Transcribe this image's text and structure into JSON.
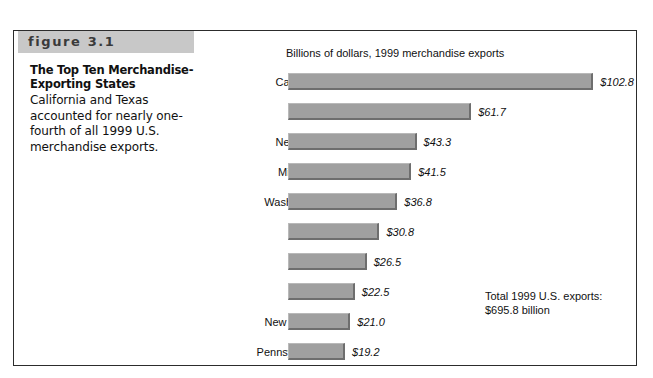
{
  "figure": {
    "band_label": "figure 3.1",
    "caption_title": "The Top Ten Merchandise-Exporting States",
    "caption_body": "California and Texas accounted for nearly one-fourth of all 1999 U.S. merchandise exports.",
    "total_note_line1": "Total 1999 U.S. exports:",
    "total_note_line2": "$695.8 billion"
  },
  "colors": {
    "band_gray": "#c8c8c8",
    "bar_fill": "#a0a0a0",
    "bar_shadow": "#6e6e6e",
    "bar_highlight": "#b9b9b9",
    "frame_border": "#2c2c2c"
  },
  "chart_data": {
    "type": "bar",
    "orientation": "horizontal",
    "title": "Billions of dollars, 1999 merchandise exports",
    "xlabel": "",
    "ylabel": "",
    "grid": false,
    "legend": false,
    "xlim": [
      0,
      110
    ],
    "categories": [
      "California",
      "Texas",
      "New York",
      "Michigan",
      "Washington",
      "Illinois",
      "Ohio",
      "Florida",
      "New Jersey",
      "Pennsylvania"
    ],
    "values": [
      102.8,
      61.7,
      43.3,
      41.5,
      36.8,
      30.8,
      26.5,
      22.5,
      21.0,
      19.2
    ],
    "value_labels": [
      "$102.8",
      "$61.7",
      "$43.3",
      "$41.5",
      "$36.8",
      "$30.8",
      "$26.5",
      "$22.5",
      "$21.0",
      "$19.2"
    ],
    "annotations": [
      "Total 1999 U.S. exports:",
      "$695.8 billion"
    ]
  }
}
